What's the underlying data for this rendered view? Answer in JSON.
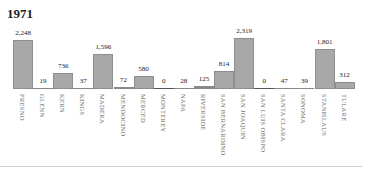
{
  "title": "1971",
  "chart_data": {
    "type": "bar",
    "title": "1971",
    "xlabel": "",
    "ylabel": "",
    "grid": false,
    "legend": null,
    "ylim": [
      0,
      2400
    ],
    "categories": [
      "FRESNO",
      "GLENN",
      "KERN",
      "KINGS",
      "MADERA",
      "MENDOCINO",
      "MERCED",
      "MONTEREY",
      "NAPA",
      "RIVERSIDE",
      "SAN BERNARDINO",
      "SAN JOAQUIN",
      "SAN LUIS OBISPO",
      "SANTA CLARA",
      "SONOMA",
      "STANISLAUS",
      "TULARE"
    ],
    "values": [
      2248,
      19,
      736,
      37,
      1596,
      72,
      580,
      0,
      28,
      125,
      814,
      2319,
      0,
      47,
      39,
      1801,
      312
    ],
    "value_labels": [
      "2,248",
      "19",
      "736",
      "37",
      "1,596",
      "72",
      "580",
      "0",
      "28",
      "125",
      "814",
      "2,319",
      "0",
      "47",
      "39",
      "1,801",
      "312"
    ]
  },
  "colors": {
    "bar": "#a8a8a8",
    "bar_border": "#8e8e8e",
    "label": "#666666",
    "divider": "#cfcfcf"
  }
}
